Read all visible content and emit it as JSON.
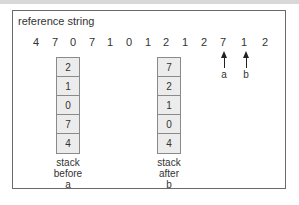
{
  "diagram": {
    "title": "reference string",
    "reference_string": [
      "4",
      "7",
      "0",
      "7",
      "1",
      "0",
      "1",
      "2",
      "1",
      "2",
      "7",
      "1",
      "2"
    ],
    "markers": [
      {
        "label": "a",
        "points_to_index": 9
      },
      {
        "label": "b",
        "points_to_index": 10
      }
    ],
    "stacks": [
      {
        "cells": [
          "2",
          "1",
          "0",
          "7",
          "4"
        ],
        "caption": [
          "stack",
          "before",
          "a"
        ]
      },
      {
        "cells": [
          "7",
          "2",
          "1",
          "0",
          "4"
        ],
        "caption": [
          "stack",
          "after",
          "b"
        ]
      }
    ]
  }
}
